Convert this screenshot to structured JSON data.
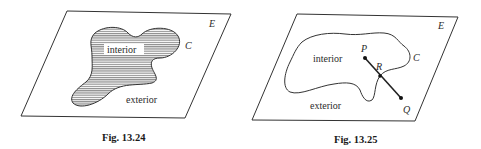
{
  "figures": [
    {
      "id": "fig-13-24",
      "caption": "Fig. 13.24",
      "plane_label": "E",
      "curve_label": "C",
      "interior_label": "interior",
      "exterior_label": "exterior",
      "interior_shaded": true
    },
    {
      "id": "fig-13-25",
      "caption": "Fig. 13.25",
      "plane_label": "E",
      "curve_label": "C",
      "interior_label": "interior",
      "exterior_label": "exterior",
      "points": {
        "P": "P",
        "R": "R",
        "Q": "Q"
      }
    }
  ],
  "colors": {
    "line": "#333333",
    "hatch": "#6a6a6a",
    "background": "#ffffff"
  }
}
